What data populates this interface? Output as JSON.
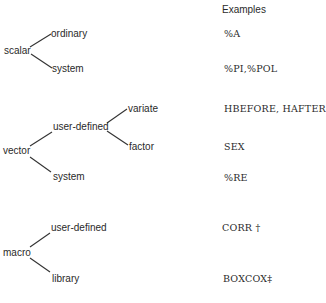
{
  "header": {
    "examples_label": "Examples"
  },
  "tree": {
    "scalar": {
      "label": "scalar",
      "children": [
        {
          "label": "ordinary",
          "example": "%A"
        },
        {
          "label": "system",
          "example": "%PI,%POL"
        }
      ]
    },
    "vector": {
      "label": "vector",
      "user_defined": {
        "label": "user-defined",
        "children": [
          {
            "label": "variate",
            "example": "HBEFORE,  HAFTER"
          },
          {
            "label": "factor",
            "example": "SEX"
          }
        ]
      },
      "system": {
        "label": "system",
        "example": "%RE"
      }
    },
    "macro": {
      "label": "macro",
      "children": [
        {
          "label": "user-defined",
          "example": "CORR †"
        },
        {
          "label": "library",
          "example": "BOXCOX‡"
        }
      ]
    }
  }
}
